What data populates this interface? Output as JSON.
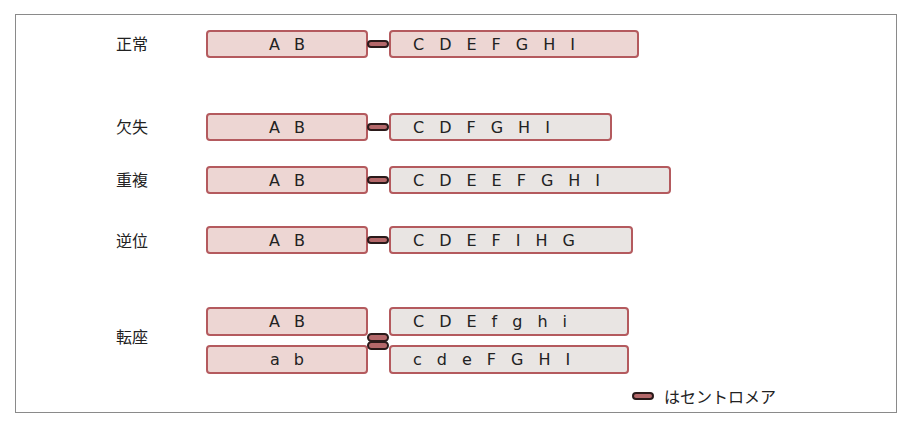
{
  "rows": [
    {
      "label": "正常",
      "p_genes": [
        "A",
        "B"
      ],
      "q_genes": [
        "C",
        "D",
        "E",
        "F",
        "G",
        "H",
        "I"
      ]
    },
    {
      "label": "欠失",
      "p_genes": [
        "A",
        "B"
      ],
      "q_genes": [
        "C",
        "D",
        "F",
        "G",
        "H",
        "I"
      ]
    },
    {
      "label": "重複",
      "p_genes": [
        "A",
        "B"
      ],
      "q_genes": [
        "C",
        "D",
        "E",
        "E",
        "F",
        "G",
        "H",
        "I"
      ]
    },
    {
      "label": "逆位",
      "p_genes": [
        "A",
        "B"
      ],
      "q_genes": [
        "C",
        "D",
        "E",
        "F",
        "I",
        "H",
        "G"
      ]
    },
    {
      "label": "転座",
      "top": {
        "p_genes": [
          "A",
          "B"
        ],
        "q_genes": [
          "C",
          "D",
          "E",
          "f",
          "g",
          "h",
          "i"
        ]
      },
      "bottom": {
        "p_genes": [
          "a",
          "b"
        ],
        "q_genes": [
          "c",
          "d",
          "e",
          "F",
          "G",
          "H",
          "I"
        ]
      }
    }
  ],
  "legend": {
    "text": "はセントロメア",
    "icon": "centromere-icon"
  },
  "colors": {
    "p_arm_fill": "#edd6d3",
    "q_arm_fill": "#e9e5e3",
    "arm_border": "#b45a5e",
    "centromere": "#b4686a"
  }
}
